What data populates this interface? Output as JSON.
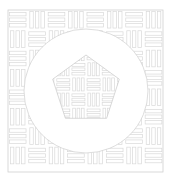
{
  "canvas": {
    "width": 172,
    "height": 181,
    "background": "#ffffff",
    "title": "Basketweave parquet square with circle and pentagon inlay"
  },
  "style": {
    "line_color": "#d9d9d9",
    "frame_color": "#d0d0d0",
    "circle_stroke": "#cfcfcf",
    "pentagon_stroke": "#c9c9c9",
    "fill_color": "#ffffff",
    "stroke_width": 0.7,
    "frame_stroke_width": 0.8
  },
  "frame": {
    "x": 8,
    "y": 10,
    "width": 155,
    "height": 162,
    "label": "outer-square-frame"
  },
  "pattern": {
    "name": "basketweave",
    "cell_size": 19.4,
    "columns": 8,
    "rows": 8,
    "slats_per_cell": 3,
    "description": "Alternating blocks of three parallel horizontal slats and three parallel vertical slats, checkerboard phase."
  },
  "circle": {
    "cx": 86,
    "cy": 91,
    "r": 62,
    "label": "inner-circle-mask"
  },
  "pentagon": {
    "cx": 86,
    "cy": 90,
    "circumradius": 35,
    "rotation_deg": 0,
    "label": "pentagon-inlay",
    "points": "86,55 119.3,79.2 106.6,118.3 65.4,118.3 52.7,79.2"
  },
  "layers": [
    {
      "name": "background",
      "label": "White background"
    },
    {
      "name": "square-parquet",
      "label": "Square basketweave field"
    },
    {
      "name": "circle-mask",
      "label": "White circle covering parquet"
    },
    {
      "name": "pentagon-parquet",
      "label": "Pentagon with basketweave fill"
    }
  ]
}
